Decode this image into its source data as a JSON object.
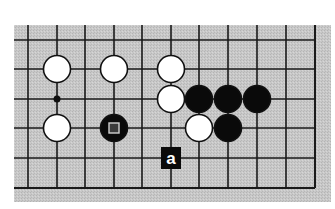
{
  "diagram": {
    "type": "go-board-partial",
    "board_color": "#c4c4c4",
    "line_color": "#1a1a1a",
    "columns_x": [
      28,
      57,
      85,
      114,
      142,
      171,
      199,
      228,
      257,
      286,
      315
    ],
    "rows_y": [
      40,
      69,
      99,
      128,
      158,
      188
    ],
    "board_rect": {
      "x": 14,
      "y": 25,
      "w": 317,
      "h": 177
    },
    "edges": {
      "right": true,
      "bottom": true,
      "top": false,
      "left": false
    },
    "star_points": [
      {
        "col": 1,
        "row": 2
      }
    ],
    "stones": [
      {
        "color": "white",
        "col": 1,
        "row": 1
      },
      {
        "color": "white",
        "col": 3,
        "row": 1
      },
      {
        "color": "white",
        "col": 5,
        "row": 1
      },
      {
        "color": "white",
        "col": 5,
        "row": 2
      },
      {
        "color": "white",
        "col": 1,
        "row": 3
      },
      {
        "color": "white",
        "col": 6,
        "row": 3
      },
      {
        "color": "black",
        "col": 6,
        "row": 2
      },
      {
        "color": "black",
        "col": 7,
        "row": 2
      },
      {
        "color": "black",
        "col": 8,
        "row": 2
      },
      {
        "color": "black",
        "col": 7,
        "row": 3
      },
      {
        "color": "black",
        "col": 3,
        "row": 3,
        "marker": "square"
      }
    ],
    "labels": [
      {
        "text": "a",
        "col": 5,
        "row": 4
      }
    ]
  }
}
